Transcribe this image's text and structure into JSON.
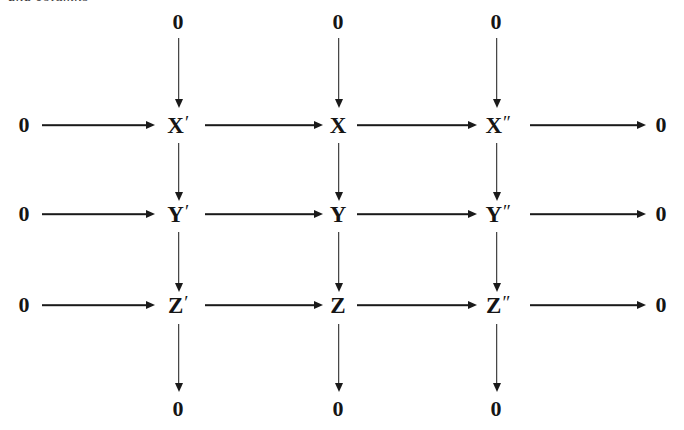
{
  "caption": {
    "text": "and columns"
  },
  "diagram": {
    "kind": "commutative-diagram",
    "zero_label": "0",
    "rows": [
      {
        "name": "row-x",
        "nodes": [
          {
            "base": "X",
            "prime": "′",
            "label": "X′"
          },
          {
            "base": "X",
            "prime": "",
            "label": "X"
          },
          {
            "base": "X",
            "prime": "″",
            "label": "X″"
          }
        ]
      },
      {
        "name": "row-y",
        "nodes": [
          {
            "base": "Y",
            "prime": "′",
            "label": "Y′"
          },
          {
            "base": "Y",
            "prime": "",
            "label": "Y"
          },
          {
            "base": "Y",
            "prime": "″",
            "label": "Y″"
          }
        ]
      },
      {
        "name": "row-z",
        "nodes": [
          {
            "base": "Z",
            "prime": "′",
            "label": "Z′"
          },
          {
            "base": "Z",
            "prime": "",
            "label": "Z"
          },
          {
            "base": "Z",
            "prime": "″",
            "label": "Z″"
          }
        ]
      }
    ],
    "row_terminals": {
      "left": [
        "0",
        "0",
        "0"
      ],
      "right": [
        "0",
        "0",
        "0"
      ]
    },
    "column_terminals": {
      "top": [
        "0",
        "0",
        "0"
      ],
      "bottom": [
        "0",
        "0",
        "0"
      ]
    },
    "colors": {
      "ink": "#151515",
      "arrow": "#1a1a1a",
      "background": "#ffffff",
      "caption": "#3b3b3b"
    }
  }
}
